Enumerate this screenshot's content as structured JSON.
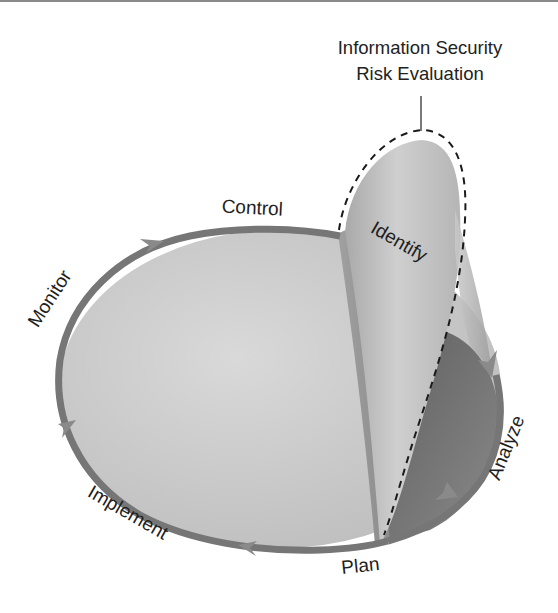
{
  "diagram": {
    "title_line1": "Information Security",
    "title_line2": "Risk Evaluation",
    "stages": {
      "control": "Control",
      "monitor": "Monitor",
      "implement": "Implement",
      "plan": "Plan",
      "analyze": "Analyze",
      "identify": "Identify"
    },
    "colors": {
      "ring": "#767676",
      "ellipse_fill": "#cfcfcf",
      "lobe_fill": "#b8b8b8",
      "wedge_dark": "#6e6e6e",
      "dash": "#1a1a1a",
      "text": "#1e1e1e"
    }
  }
}
